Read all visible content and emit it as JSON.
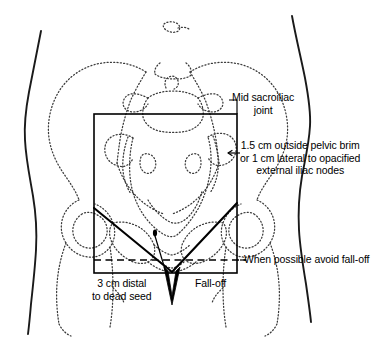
{
  "figure": {
    "colors": {
      "body_outline": "#1a1a1a",
      "bone_outline": "#3c3c3c",
      "field_box": "#000000",
      "block_line": "#000000",
      "dashed_line": "#000000",
      "text": "#000000",
      "background": "#ffffff"
    }
  },
  "annotations": {
    "sacroiliac": {
      "line1": "Mid sacroiliac",
      "line2": "joint"
    },
    "pelvic_brim": {
      "line1": "1.5 cm outside pelvic brim",
      "line2": "or 1 cm lateral to opacified",
      "line3": "external iliac nodes"
    },
    "avoid_falloff": {
      "line1": "When possible avoid fall-off"
    },
    "dead_seed": {
      "line1": "3 cm distal",
      "line2": "to dead seed"
    },
    "falloff": {
      "line1": "Fall-off"
    }
  },
  "geometry": {
    "field_box": {
      "left": 94,
      "top": 114,
      "right": 237,
      "bottom": 273
    },
    "dashed_line_y": 260,
    "block_apex": {
      "x": 172,
      "y": 272
    },
    "seed_marker": {
      "x": 155,
      "y": 233
    }
  }
}
